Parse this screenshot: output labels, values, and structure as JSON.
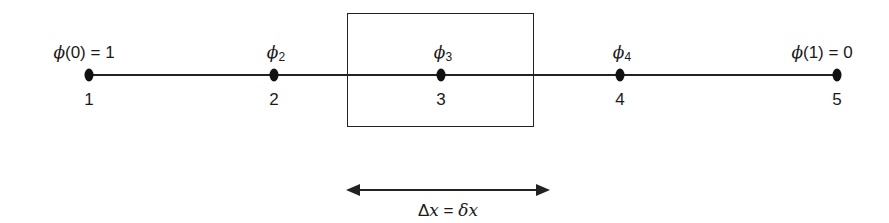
{
  "diagram": {
    "type": "1d-finite-volume-grid",
    "nodes": [
      {
        "index": "1",
        "label_symbol": "ϕ",
        "label_text": "(0) = 1",
        "subscript": "",
        "x": 89
      },
      {
        "index": "2",
        "label_symbol": "ϕ",
        "label_text": "",
        "subscript": "2",
        "x": 274
      },
      {
        "index": "3",
        "label_symbol": "ϕ",
        "label_text": "",
        "subscript": "3",
        "x": 441
      },
      {
        "index": "4",
        "label_symbol": "ϕ",
        "label_text": "",
        "subscript": "4",
        "x": 620
      },
      {
        "index": "5",
        "label_symbol": "ϕ",
        "label_text": "(1) = 0",
        "subscript": "",
        "x": 837
      }
    ],
    "control_volume": {
      "around_node": "3"
    },
    "spacing_arrow": {
      "label_delta": "Δ",
      "label_x1": "x",
      "label_eq": " = ",
      "label_delta2": "δ",
      "label_x2": "x"
    },
    "colors": {
      "ink": "#1a1a1a",
      "background": "#ffffff"
    }
  }
}
